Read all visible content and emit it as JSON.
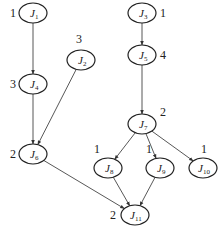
{
  "diagram": {
    "type": "directed-graph",
    "nodes": [
      {
        "id": "J1",
        "label": "J",
        "sub": "1",
        "weight": "1",
        "cx": 33,
        "cy": 13,
        "wx": 10,
        "wy": 17
      },
      {
        "id": "J2",
        "label": "J",
        "sub": "2",
        "weight": "3",
        "cx": 81,
        "cy": 60,
        "wx": 76,
        "wy": 43
      },
      {
        "id": "J3",
        "label": "J",
        "sub": "3",
        "weight": "1",
        "cx": 142,
        "cy": 13,
        "wx": 160,
        "wy": 17
      },
      {
        "id": "J4",
        "label": "J",
        "sub": "4",
        "weight": "3",
        "cx": 33,
        "cy": 84,
        "wx": 10,
        "wy": 88
      },
      {
        "id": "J5",
        "label": "J",
        "sub": "5",
        "weight": "4",
        "cx": 142,
        "cy": 55,
        "wx": 160,
        "wy": 59
      },
      {
        "id": "J6",
        "label": "J",
        "sub": "6",
        "weight": "2",
        "cx": 33,
        "cy": 154,
        "wx": 10,
        "wy": 158
      },
      {
        "id": "J7",
        "label": "J",
        "sub": "7",
        "weight": "2",
        "cx": 142,
        "cy": 124,
        "wx": 160,
        "wy": 116
      },
      {
        "id": "J8",
        "label": "J",
        "sub": "8",
        "weight": "1",
        "cx": 108,
        "cy": 168,
        "wx": 94,
        "wy": 153
      },
      {
        "id": "J9",
        "label": "J",
        "sub": "9",
        "weight": "1",
        "cx": 160,
        "cy": 168,
        "wx": 146,
        "wy": 153
      },
      {
        "id": "J10",
        "label": "J",
        "sub": "10",
        "weight": "1",
        "cx": 203,
        "cy": 168,
        "wx": 201,
        "wy": 153
      },
      {
        "id": "J11",
        "label": "J",
        "sub": "11",
        "weight": "2",
        "cx": 135,
        "cy": 215,
        "wx": 110,
        "wy": 219
      }
    ],
    "edges": [
      {
        "from": "J1",
        "to": "J4"
      },
      {
        "from": "J4",
        "to": "J6"
      },
      {
        "from": "J2",
        "to": "J6"
      },
      {
        "from": "J3",
        "to": "J5"
      },
      {
        "from": "J5",
        "to": "J7"
      },
      {
        "from": "J7",
        "to": "J8"
      },
      {
        "from": "J7",
        "to": "J9"
      },
      {
        "from": "J7",
        "to": "J10"
      },
      {
        "from": "J6",
        "to": "J11"
      },
      {
        "from": "J8",
        "to": "J11"
      },
      {
        "from": "J9",
        "to": "J11"
      }
    ],
    "node_rx": 14,
    "node_ry": 10,
    "colors": {
      "stroke": "#222222",
      "edge": "#444444",
      "background": "#ffffff"
    }
  }
}
